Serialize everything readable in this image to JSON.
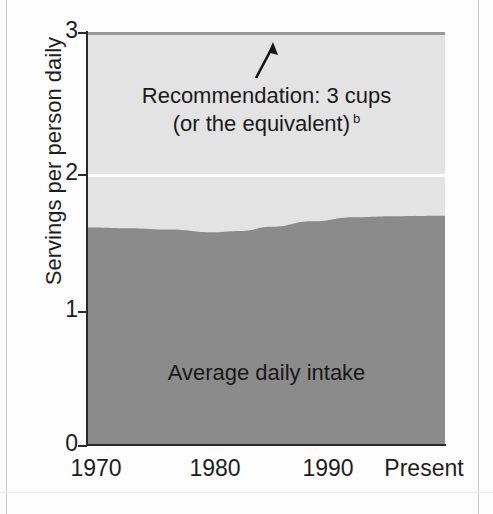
{
  "figure": {
    "cropped_top_caption": "",
    "background_color": "#fdfdfd"
  },
  "colors": {
    "recommendation_band": "#e3e3e3",
    "intake_band": "#8b8b8b",
    "gridline": "#ffffff",
    "axis": "#2a2a2a",
    "text": "#1d1d1d"
  },
  "chart_data": {
    "type": "area",
    "title": "",
    "xlabel": "",
    "ylabel": "Servings per person daily",
    "ylim": [
      0,
      3
    ],
    "yticks": [
      0,
      1,
      2,
      3
    ],
    "ytick_labels": [
      "0",
      "1",
      "2",
      "3"
    ],
    "xtick_labels": [
      "1970",
      "1980",
      "1990",
      "Present"
    ],
    "x": [
      1970,
      1980,
      1990,
      2005
    ],
    "grid": "horizontal white gridlines at y = 1 and y = 2",
    "legend": "none (inline labels)",
    "series": [
      {
        "name": "Average daily intake",
        "color": "#8b8b8b",
        "values": [
          1.58,
          1.56,
          1.6,
          1.66
        ],
        "detail_points": [
          {
            "x": 1970,
            "y": 1.58
          },
          {
            "x": 1974,
            "y": 1.575
          },
          {
            "x": 1978,
            "y": 1.565
          },
          {
            "x": 1982,
            "y": 1.545
          },
          {
            "x": 1985,
            "y": 1.555
          },
          {
            "x": 1988,
            "y": 1.585
          },
          {
            "x": 1992,
            "y": 1.625
          },
          {
            "x": 1996,
            "y": 1.655
          },
          {
            "x": 2000,
            "y": 1.662
          },
          {
            "x": 2005,
            "y": 1.665
          }
        ]
      },
      {
        "name": "Recommendation: 3 cups (or the equivalent)",
        "color": "#e3e3e3",
        "values": [
          3,
          3,
          3,
          3
        ]
      }
    ],
    "annotations": [
      {
        "name": "recommendation-label",
        "line1": "Recommendation: 3 cups",
        "line2": "(or the equivalent)",
        "footnote_marker": "b",
        "arrow": "up-arrow pointing to the 3 cups recommendation level"
      },
      {
        "name": "intake-label",
        "text": "Average daily intake"
      }
    ]
  },
  "axis": {
    "y_title": "Servings per person daily",
    "y_ticks": [
      {
        "label": "3",
        "value": 3,
        "top": 32
      },
      {
        "label": "2",
        "value": 2,
        "top": 174
      },
      {
        "label": "1",
        "value": 1,
        "top": 311
      },
      {
        "label": "0",
        "value": 0,
        "top": 445
      }
    ],
    "x_ticks": [
      {
        "label": "1970",
        "left": 96
      },
      {
        "label": "1980",
        "left": 215
      },
      {
        "label": "1990",
        "left": 328
      },
      {
        "label": "Present",
        "left": 424
      }
    ]
  },
  "annotations": {
    "recommendation_line1": "Recommendation: 3 cups",
    "recommendation_line2": "(or the equivalent)",
    "recommendation_footnote": "b",
    "intake_label": "Average daily intake",
    "arrow_icon": "up-arrow-icon"
  }
}
